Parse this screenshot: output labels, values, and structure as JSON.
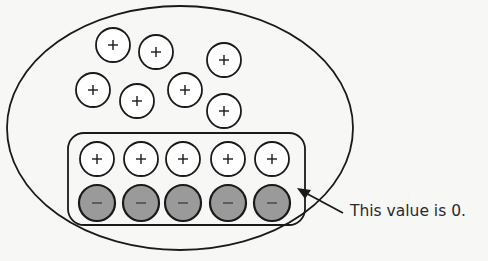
{
  "diagram": {
    "annotation": "This value is 0.",
    "colors": {
      "stroke": "#1a1a1a",
      "negative_fill": "#9a9a9a",
      "positive_fill": "#ffffff",
      "background": "#f7f7f5"
    },
    "outer_ellipse": {
      "cx": 180,
      "cy": 128,
      "rx": 173,
      "ry": 122
    },
    "free_positive_charges": [
      {
        "x": 113,
        "y": 45,
        "sign": "+"
      },
      {
        "x": 156,
        "y": 52,
        "sign": "+"
      },
      {
        "x": 224,
        "y": 60,
        "sign": "+"
      },
      {
        "x": 93,
        "y": 90,
        "sign": "+"
      },
      {
        "x": 137,
        "y": 101,
        "sign": "+"
      },
      {
        "x": 185,
        "y": 90,
        "sign": "+"
      },
      {
        "x": 224,
        "y": 111,
        "sign": "+"
      }
    ],
    "paired_group": {
      "positive_row": [
        {
          "x": 97,
          "y": 159,
          "sign": "+"
        },
        {
          "x": 141,
          "y": 159,
          "sign": "+"
        },
        {
          "x": 183,
          "y": 159,
          "sign": "+"
        },
        {
          "x": 228,
          "y": 159,
          "sign": "+"
        },
        {
          "x": 272,
          "y": 159,
          "sign": "+"
        }
      ],
      "negative_row": [
        {
          "x": 97,
          "y": 203,
          "sign": "−"
        },
        {
          "x": 141,
          "y": 203,
          "sign": "−"
        },
        {
          "x": 183,
          "y": 203,
          "sign": "−"
        },
        {
          "x": 228,
          "y": 203,
          "sign": "−"
        },
        {
          "x": 272,
          "y": 203,
          "sign": "−"
        }
      ]
    }
  }
}
